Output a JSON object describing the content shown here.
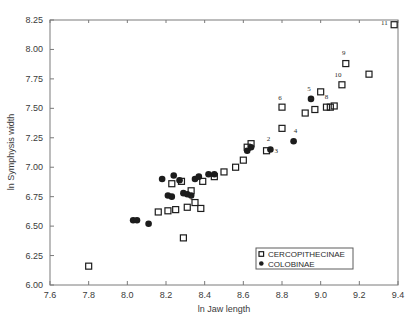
{
  "chart_data": {
    "type": "scatter",
    "title": "",
    "xlabel": "ln Jaw length",
    "ylabel": "ln Symphysis width",
    "xlim": [
      7.6,
      9.4
    ],
    "ylim": [
      6.0,
      8.25
    ],
    "xticks": [
      "7.6",
      "7.8",
      "8.0",
      "8.2",
      "8.4",
      "8.6",
      "8.8",
      "9.0",
      "9.2",
      "9.4"
    ],
    "yticks": [
      "6.00",
      "6.25",
      "6.50",
      "6.75",
      "7.00",
      "7.25",
      "7.50",
      "7.75",
      "8.00",
      "8.25"
    ],
    "grid": false,
    "legend_position": "bottom-right",
    "legend": [
      {
        "label": "CERCOPITHECINAE",
        "marker": "open-square"
      },
      {
        "label": "COLOBINAE",
        "marker": "filled-circle"
      }
    ],
    "series": [
      {
        "name": "CERCOPITHECINAE",
        "marker": "open-square",
        "points": [
          {
            "x": 7.8,
            "y": 6.16
          },
          {
            "x": 8.16,
            "y": 6.62
          },
          {
            "x": 8.21,
            "y": 6.63
          },
          {
            "x": 8.25,
            "y": 6.64
          },
          {
            "x": 8.29,
            "y": 6.4
          },
          {
            "x": 8.31,
            "y": 6.66
          },
          {
            "x": 8.33,
            "y": 6.8
          },
          {
            "x": 8.35,
            "y": 6.7
          },
          {
            "x": 8.38,
            "y": 6.65
          },
          {
            "x": 8.28,
            "y": 6.88
          },
          {
            "x": 8.23,
            "y": 6.86
          },
          {
            "x": 8.39,
            "y": 6.88
          },
          {
            "x": 8.45,
            "y": 6.92
          },
          {
            "x": 8.5,
            "y": 6.96
          },
          {
            "x": 8.56,
            "y": 7.0
          },
          {
            "x": 8.62,
            "y": 7.17
          },
          {
            "x": 8.64,
            "y": 7.2
          },
          {
            "x": 8.6,
            "y": 7.06
          },
          {
            "x": 8.72,
            "y": 7.14
          },
          {
            "x": 8.8,
            "y": 7.33
          },
          {
            "x": 8.8,
            "y": 7.51
          },
          {
            "x": 8.92,
            "y": 7.46
          },
          {
            "x": 8.97,
            "y": 7.49
          },
          {
            "x": 9.0,
            "y": 7.64
          },
          {
            "x": 9.03,
            "y": 7.51
          },
          {
            "x": 9.05,
            "y": 7.51
          },
          {
            "x": 9.07,
            "y": 7.52
          },
          {
            "x": 9.11,
            "y": 7.7
          },
          {
            "x": 9.13,
            "y": 7.88
          },
          {
            "x": 9.25,
            "y": 7.79
          },
          {
            "x": 9.38,
            "y": 8.21
          }
        ]
      },
      {
        "name": "COLOBINAE",
        "marker": "filled-circle",
        "points": [
          {
            "x": 8.03,
            "y": 6.55
          },
          {
            "x": 8.05,
            "y": 6.55
          },
          {
            "x": 8.11,
            "y": 6.52
          },
          {
            "x": 8.18,
            "y": 6.9
          },
          {
            "x": 8.24,
            "y": 6.93
          },
          {
            "x": 8.27,
            "y": 6.89
          },
          {
            "x": 8.29,
            "y": 6.78
          },
          {
            "x": 8.31,
            "y": 6.77
          },
          {
            "x": 8.33,
            "y": 6.76
          },
          {
            "x": 8.35,
            "y": 6.9
          },
          {
            "x": 8.37,
            "y": 6.92
          },
          {
            "x": 8.21,
            "y": 6.76
          },
          {
            "x": 8.23,
            "y": 6.75
          },
          {
            "x": 8.42,
            "y": 6.94
          },
          {
            "x": 8.45,
            "y": 6.94
          },
          {
            "x": 8.62,
            "y": 7.14
          },
          {
            "x": 8.64,
            "y": 7.17
          },
          {
            "x": 8.74,
            "y": 7.15
          },
          {
            "x": 8.86,
            "y": 7.22
          },
          {
            "x": 8.95,
            "y": 7.58
          }
        ]
      }
    ],
    "annotations": [
      {
        "text": "1",
        "x": 8.33,
        "y": 6.72
      },
      {
        "text": "2",
        "x": 8.73,
        "y": 7.22
      },
      {
        "text": "3",
        "x": 8.77,
        "y": 7.12
      },
      {
        "text": "4",
        "x": 8.87,
        "y": 7.29
      },
      {
        "text": "5",
        "x": 8.94,
        "y": 7.65
      },
      {
        "text": "6",
        "x": 8.79,
        "y": 7.57
      },
      {
        "text": "7",
        "x": 8.95,
        "y": 7.55
      },
      {
        "text": "8",
        "x": 9.03,
        "y": 7.58
      },
      {
        "text": "9",
        "x": 9.12,
        "y": 7.95
      },
      {
        "text": "10",
        "x": 9.09,
        "y": 7.77
      },
      {
        "text": "11",
        "x": 9.33,
        "y": 8.21
      }
    ]
  }
}
